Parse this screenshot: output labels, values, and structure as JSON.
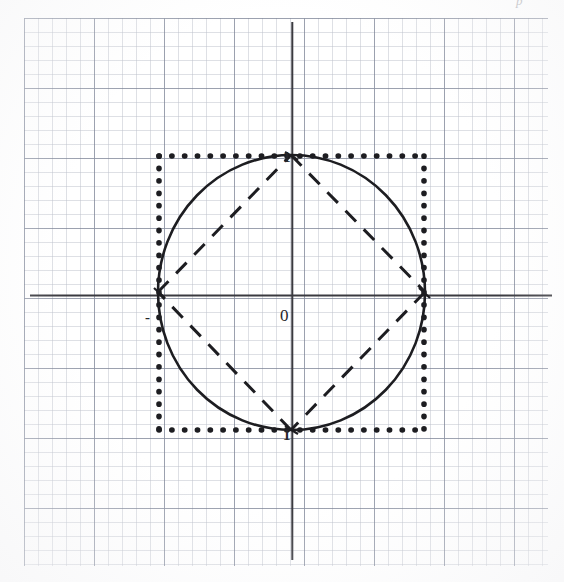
{
  "figure": {
    "background": "#ffffff",
    "ink_color": "#1d1d21",
    "grid_color": "#78809e",
    "width": 564,
    "height": 582
  },
  "labels": {
    "origin": "0",
    "one_top": "1",
    "one_bottom": "1",
    "minus_left": "-",
    "corner_mark": "p"
  },
  "axes": {
    "x_axis_y": 295,
    "y_axis_x": 292,
    "x_axis_from": 30,
    "x_axis_to": 552,
    "y_axis_from": 22,
    "y_axis_to": 560,
    "color": "#3a3a40"
  },
  "grid": {
    "fine_spacing_px": 14,
    "major_spacing_px": 70,
    "left": 24,
    "top": 18,
    "width": 524,
    "height": 548,
    "visible": true
  },
  "chart_data": {
    "type": "line",
    "xlabel": "",
    "ylabel": "",
    "xlim": [
      -2.18,
      1.95
    ],
    "ylim": [
      -1.99,
      2.06
    ],
    "grid": true,
    "legend": "none",
    "center": {
      "x": 291.5,
      "y": 292.5
    },
    "unit_px": {
      "x": 133.5,
      "y": 137.5
    },
    "series": [
      {
        "name": "l-infinity unit ball (square)",
        "style": "dotted",
        "linewidth": 3.2,
        "color": "#1d1d21",
        "points": [
          {
            "x": -1,
            "y": 1
          },
          {
            "x": 1,
            "y": 1
          },
          {
            "x": 1,
            "y": -1
          },
          {
            "x": -1,
            "y": -1
          },
          {
            "x": -1,
            "y": 1
          }
        ],
        "pixel_bounds": {
          "left": 158,
          "top": 155,
          "right": 425,
          "bottom": 430
        }
      },
      {
        "name": "l2 unit ball (circle)",
        "style": "solid",
        "linewidth": 2.6,
        "color": "#1d1d21",
        "radius": 1,
        "pixel_center": {
          "cx": 291.5,
          "cy": 292.5
        },
        "pixel_radius": {
          "rx": 133.5,
          "ry": 137.5
        }
      },
      {
        "name": "l1 unit ball (diamond)",
        "style": "dashed",
        "linewidth": 3.0,
        "color": "#1d1d21",
        "points": [
          {
            "x": 0,
            "y": 1
          },
          {
            "x": 1,
            "y": 0
          },
          {
            "x": 0,
            "y": -1
          },
          {
            "x": -1,
            "y": 0
          },
          {
            "x": 0,
            "y": 1
          }
        ],
        "pixel_vertices": [
          {
            "x": 291,
            "y": 155
          },
          {
            "x": 425,
            "y": 292
          },
          {
            "x": 291,
            "y": 430
          },
          {
            "x": 158,
            "y": 292
          }
        ]
      }
    ],
    "annotations": [
      {
        "text": "0",
        "x": -0.12,
        "y": -0.11,
        "px": 280,
        "py": 307
      },
      {
        "text": "1",
        "x": -0.04,
        "y": 1.0,
        "px": 283,
        "py": 150
      },
      {
        "text": "1",
        "x": -0.04,
        "y": -1.0,
        "px": 283,
        "py": 428
      },
      {
        "text": "-",
        "x": -1.12,
        "y": -0.09,
        "px": 145,
        "py": 310
      }
    ]
  }
}
